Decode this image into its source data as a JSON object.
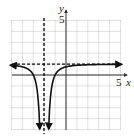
{
  "chart_data": {
    "type": "line",
    "title": "",
    "function": "y = 1 - 1/(x+2)^2",
    "xlabel": "x",
    "ylabel": "y",
    "xlim": [
      -5,
      5
    ],
    "ylim": [
      -5,
      5
    ],
    "grid": true,
    "tick_labels": {
      "x": [
        "5"
      ],
      "y": [
        "5"
      ]
    },
    "asymptotes": {
      "vertical": [
        -2
      ],
      "horizontal": [
        1
      ]
    },
    "series": [
      {
        "name": "left-branch",
        "x": [
          -5,
          -4.5,
          -4,
          -3.5,
          -3,
          -2.75,
          -2.5,
          -2.4
        ],
        "y": [
          0.89,
          0.84,
          0.75,
          0.56,
          0,
          -0.78,
          -3,
          -5.25
        ]
      },
      {
        "name": "right-branch",
        "x": [
          -1.6,
          -1.5,
          -1.25,
          -1,
          -0.5,
          0,
          1,
          2,
          3,
          4,
          5
        ],
        "y": [
          -5.25,
          -3,
          -0.78,
          0,
          0.56,
          0.75,
          0.89,
          0.94,
          0.96,
          0.97,
          0.98
        ]
      }
    ],
    "colors": {
      "curve": "#111111",
      "grid": "#9a9a9a",
      "axis": "#333333",
      "asymptote": "#111111"
    }
  },
  "labels": {
    "x_axis": "x",
    "y_axis": "y",
    "x_tick": "5",
    "y_tick": "5"
  }
}
